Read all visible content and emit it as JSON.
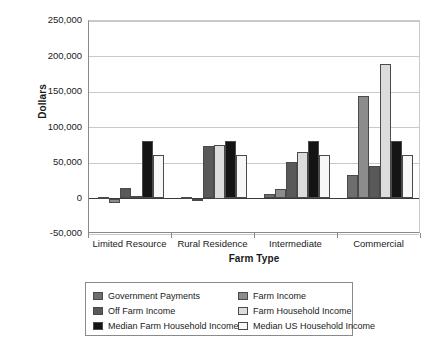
{
  "chart_data": {
    "type": "bar",
    "title": "",
    "xlabel": "Farm Type",
    "ylabel": "Dollars",
    "categories": [
      "Limited Resource",
      "Rural Residence",
      "Intermediate",
      "Commercial"
    ],
    "ylim": [
      -50000,
      250000
    ],
    "ytick_values": [
      250000,
      200000,
      150000,
      100000,
      50000,
      0,
      -50000
    ],
    "ytick_labels": [
      "250,000",
      "200,000",
      "150,000",
      "100,000",
      "50,000",
      "0",
      "-50,000"
    ],
    "grid": true,
    "legend_position": "below-plot",
    "series": [
      {
        "name": "Government  Payments",
        "color": "#6e6e6e",
        "values": [
          2000,
          1500,
          6000,
          33000
        ]
      },
      {
        "name": "Farm Income",
        "color": "#8c8c8c",
        "values": [
          -7000,
          0,
          13000,
          145000
        ]
      },
      {
        "name": "Off Farm Income",
        "color": "#595959",
        "values": [
          15000,
          74000,
          51000,
          46000
        ]
      },
      {
        "name": "Farm Household Income",
        "color": "#dcdcdc",
        "values": [
          4000,
          75000,
          65000,
          190000
        ]
      },
      {
        "name": "Median Farm Household Income",
        "color": "#141414",
        "values": [
          81000,
          81000,
          81000,
          81000
        ]
      },
      {
        "name": "Median US Household Income",
        "color": "#f7f7f7",
        "values": [
          61000,
          61000,
          61000,
          61000
        ]
      }
    ]
  }
}
